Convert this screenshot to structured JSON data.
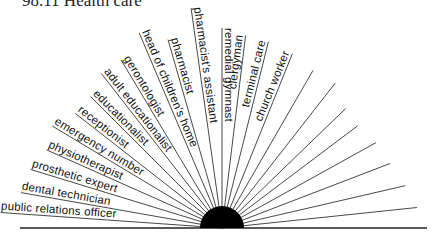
{
  "heading": "98.11 Health care",
  "diagram": {
    "center": {
      "x": 222,
      "y": 228
    },
    "hub_radius": 22,
    "baseline": {
      "x1": 20,
      "x2": 427
    },
    "labeled_rays": [
      {
        "label": "public relations officer",
        "angle": 176,
        "len": 222,
        "tx": 4,
        "ty": 222
      },
      {
        "label": "dental technician",
        "angle": 170,
        "len": 204,
        "tx": 23,
        "ty": 201
      },
      {
        "label": "prosthetic expert",
        "angle": 163,
        "len": 200,
        "tx": 27,
        "ty": 183
      },
      {
        "label": "physiotherapist",
        "angle": 156,
        "len": 192,
        "tx": 42,
        "ty": 162
      },
      {
        "label": "emergency number",
        "angle": 149,
        "len": 198,
        "tx": 52,
        "ty": 142
      },
      {
        "label": "receptionist",
        "angle": 142,
        "len": 186,
        "tx": 72,
        "ty": 116
      },
      {
        "label": "educationalist",
        "angle": 135,
        "len": 186,
        "tx": 88,
        "ty": 90
      },
      {
        "label": "adult educationalist",
        "angle": 128,
        "len": 196,
        "tx": 110,
        "ty": 66
      },
      {
        "label": "gerontologist",
        "angle": 121,
        "len": 196,
        "tx": 132,
        "ty": 48
      },
      {
        "label": "head of children's home",
        "angle": 113,
        "len": 212,
        "tx": 152,
        "ty": 18
      },
      {
        "label": "pharmacist",
        "angle": 106,
        "len": 196,
        "tx": 180,
        "ty": 32
      },
      {
        "label": "pharmacist's assistant",
        "angle": 98,
        "len": 222,
        "tx": 210,
        "ty": 10
      },
      {
        "label": "remedial gymnast",
        "angle": 90,
        "len": 200,
        "tx": 232,
        "ty": 116
      },
      {
        "label": "clergyman",
        "angle": 83,
        "len": 194,
        "tx": 256,
        "ty": 88
      },
      {
        "label": "terminal care",
        "angle": 76,
        "len": 192,
        "tx": 272,
        "ty": 112
      },
      {
        "label": "church worker",
        "angle": 68,
        "len": 188,
        "tx": 290,
        "ty": 118
      }
    ],
    "unlabeled_rays": [
      {
        "angle": 60,
        "len": 182
      },
      {
        "angle": 52,
        "len": 184
      },
      {
        "angle": 44,
        "len": 172
      },
      {
        "angle": 37,
        "len": 170
      },
      {
        "angle": 29,
        "len": 176
      },
      {
        "angle": 21,
        "len": 180
      },
      {
        "angle": 13,
        "len": 188
      },
      {
        "angle": 6,
        "len": 196
      }
    ],
    "label_rotations": [
      -4,
      -10,
      -17,
      -24,
      -31,
      -38,
      -45,
      -52,
      -59,
      67,
      74,
      82,
      -90,
      -83,
      -76,
      -68
    ]
  }
}
